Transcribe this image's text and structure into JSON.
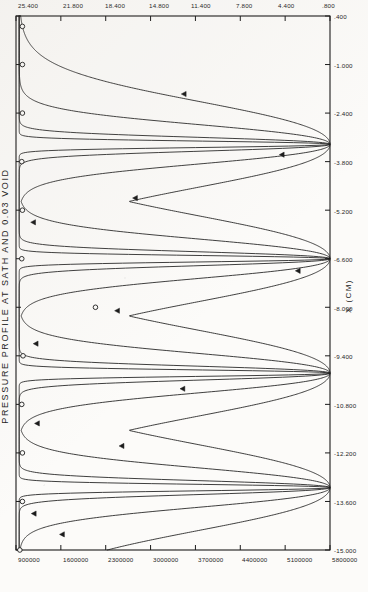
{
  "chart_data": {
    "type": "line",
    "title": "PRESSURE PROFILE AT SATH AND 0.03 VOID",
    "xlabel": "X (CM)",
    "ylabel": "GAS PRESSURE(X10",
    "ylabel_exp": "5",
    "ylabel_tail": ")",
    "xlim": [
      -15.0,
      0.4
    ],
    "ylim": [
      900000,
      5800000
    ],
    "grid": false,
    "legend": "none",
    "xtick_labels": [
      ".400",
      "-1.000",
      "-2.400",
      "-3.800",
      "-5.200",
      "-6.600",
      "-8.000",
      "-9.400",
      "-10.800",
      "-12.200",
      "-13.600",
      "-15.000"
    ],
    "xtick_values": [
      0.4,
      -1.0,
      -2.4,
      -3.8,
      -5.2,
      -6.6,
      -8.0,
      -9.4,
      -10.8,
      -12.2,
      -13.6,
      -15.0
    ],
    "ytick_labels": [
      "5800000",
      "5100000",
      "4400000",
      "3700000",
      "3000000",
      "2300000",
      "1600000",
      "900000"
    ],
    "ytick_values": [
      5800000,
      5100000,
      4400000,
      3700000,
      3000000,
      2300000,
      1600000,
      900000
    ],
    "ytick_labels_secondary": [
      "25.400",
      "21.800",
      "18.400",
      "14.800",
      "11.400",
      "7.800",
      "4.400",
      ".800"
    ],
    "ytick_values_secondary": [
      25.4,
      21.8,
      18.4,
      14.8,
      11.4,
      7.8,
      4.4,
      0.8
    ],
    "peak_positions": [
      -13.2,
      -9.9,
      -6.6,
      -3.3
    ],
    "peak_value": 5800000,
    "baseline_value": 950000,
    "series": [
      {
        "name": "narrow-peak-curve",
        "marker": "triangle",
        "peak_half_width": 0.3,
        "marker_points": [
          {
            "x": -14.55,
            "y": 1620000
          },
          {
            "x": -12.0,
            "y": 2550000
          },
          {
            "x": -10.35,
            "y": 3500000
          },
          {
            "x": -8.1,
            "y": 2480000
          },
          {
            "x": -6.95,
            "y": 5300000
          },
          {
            "x": -4.85,
            "y": 2760000
          },
          {
            "x": -3.6,
            "y": 5050000
          },
          {
            "x": -1.85,
            "y": 3520000
          }
        ]
      },
      {
        "name": "medium-peak-curve",
        "marker": "triangle",
        "peak_half_width": 0.85,
        "marker_points": [
          {
            "x": -13.95,
            "y": 1180000
          },
          {
            "x": -11.35,
            "y": 1230000
          },
          {
            "x": -9.05,
            "y": 1210000
          },
          {
            "x": -5.55,
            "y": 1170000
          }
        ]
      },
      {
        "name": "broad-peak-curve",
        "marker": "circle",
        "peak_half_width": 1.85,
        "marker_points": [
          {
            "x": -15.0,
            "y": 960000
          },
          {
            "x": -13.6,
            "y": 1000000
          },
          {
            "x": -12.2,
            "y": 1000000
          },
          {
            "x": -10.8,
            "y": 990000
          },
          {
            "x": -9.4,
            "y": 1010000
          },
          {
            "x": -8.0,
            "y": 2140000
          },
          {
            "x": -6.6,
            "y": 990000
          },
          {
            "x": -5.2,
            "y": 1000000
          },
          {
            "x": -3.8,
            "y": 990000
          },
          {
            "x": -2.4,
            "y": 1000000
          },
          {
            "x": -1.0,
            "y": 1000000
          },
          {
            "x": 0.1,
            "y": 1000000
          }
        ]
      },
      {
        "name": "sharpest-peak-curve",
        "marker": "none",
        "peak_half_width": 0.14,
        "marker_points": []
      }
    ]
  }
}
